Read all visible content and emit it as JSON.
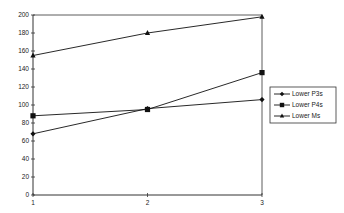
{
  "chart_data": {
    "type": "line",
    "title": "",
    "xlabel": "",
    "ylabel": "",
    "x": [
      1,
      2,
      3
    ],
    "categories": [
      "1",
      "2",
      "3"
    ],
    "ylim": [
      0,
      200
    ],
    "yticks": [
      0,
      20,
      40,
      60,
      80,
      100,
      120,
      140,
      160,
      180,
      200
    ],
    "grid": false,
    "legend_position": "right",
    "series": [
      {
        "name": "Lower P3s",
        "marker": "diamond",
        "values": [
          68,
          96,
          106
        ]
      },
      {
        "name": "Lower P4s",
        "marker": "square",
        "values": [
          88,
          95,
          136
        ]
      },
      {
        "name": "Lower Ms",
        "marker": "triangle",
        "values": [
          155,
          180,
          198
        ]
      }
    ]
  },
  "legend": {
    "items": [
      "Lower P3s",
      "Lower P4s",
      "Lower Ms"
    ]
  },
  "colors": {
    "line": "#111111",
    "axis": "#333333",
    "background": "#ffffff"
  }
}
